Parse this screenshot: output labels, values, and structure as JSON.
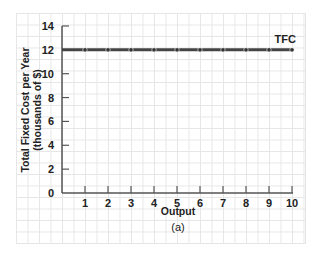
{
  "chart_data": {
    "type": "line",
    "title": "",
    "caption": "(a)",
    "xlabel": "Output",
    "ylabel_line1": "Total Fixed Cost per Year",
    "ylabel_line2": "(thousands of $)",
    "x": [
      0,
      1,
      2,
      3,
      4,
      5,
      6,
      7,
      8,
      9,
      10
    ],
    "series": [
      {
        "name": "TFC",
        "values": [
          12,
          12,
          12,
          12,
          12,
          12,
          12,
          12,
          12,
          12,
          12
        ],
        "color": "#444444"
      }
    ],
    "xticks": [
      "1",
      "2",
      "3",
      "4",
      "5",
      "6",
      "7",
      "8",
      "9",
      "10"
    ],
    "yticks": [
      "0",
      "2",
      "4",
      "6",
      "8",
      "10",
      "12",
      "14"
    ],
    "xlim": [
      0,
      10
    ],
    "ylim": [
      0,
      14
    ],
    "grid": true,
    "legend": "inline label at line end"
  }
}
